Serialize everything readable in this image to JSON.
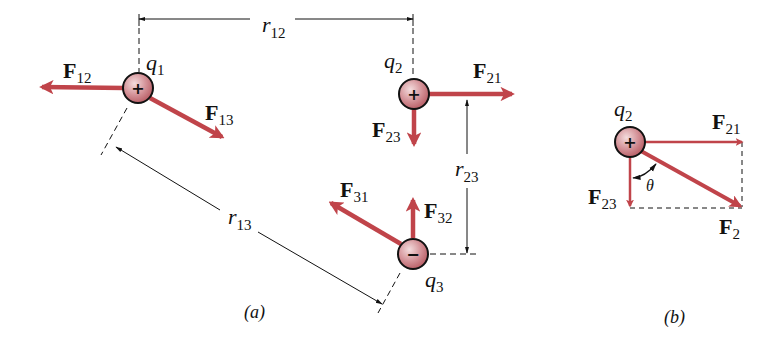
{
  "colors": {
    "force_arrow": "#c0444a",
    "charge_fill": "#c97a7f",
    "charge_highlight": "#f3dcdd",
    "outline": "#111111",
    "background": "#ffffff"
  },
  "panel_a": {
    "caption": "(a)",
    "charges": [
      {
        "id": "q1",
        "name": "q",
        "sub": "1",
        "sign": "+"
      },
      {
        "id": "q2",
        "name": "q",
        "sub": "2",
        "sign": "+"
      },
      {
        "id": "q3",
        "name": "q",
        "sub": "3",
        "sign": "−"
      }
    ],
    "forces": [
      {
        "id": "F12",
        "name": "F",
        "sub": "12"
      },
      {
        "id": "F13",
        "name": "F",
        "sub": "13"
      },
      {
        "id": "F21",
        "name": "F",
        "sub": "21"
      },
      {
        "id": "F23",
        "name": "F",
        "sub": "23"
      },
      {
        "id": "F31",
        "name": "F",
        "sub": "31"
      },
      {
        "id": "F32",
        "name": "F",
        "sub": "32"
      }
    ],
    "distances": [
      {
        "id": "r12",
        "name": "r",
        "sub": "12"
      },
      {
        "id": "r13",
        "name": "r",
        "sub": "13"
      },
      {
        "id": "r23",
        "name": "r",
        "sub": "23"
      }
    ]
  },
  "panel_b": {
    "caption": "(b)",
    "charge": {
      "name": "q",
      "sub": "2",
      "sign": "+"
    },
    "forces": [
      {
        "id": "F21",
        "name": "F",
        "sub": "21"
      },
      {
        "id": "F23",
        "name": "F",
        "sub": "23"
      },
      {
        "id": "F2",
        "name": "F",
        "sub": "2"
      }
    ],
    "angle": "θ"
  }
}
